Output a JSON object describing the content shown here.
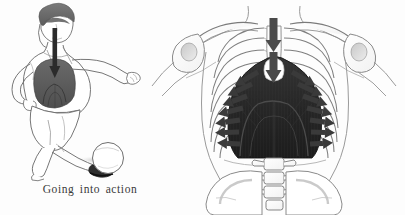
{
  "figure": {
    "caption": "Going into action",
    "panels": [
      {
        "id": "athlete",
        "name": "athlete-panel",
        "label": "Going into action",
        "description": "Line drawing of a female athlete kicking a football, shown in mid-action, with the hair and the diaphragm shaded dark and an arrow tracing the breath travelling down from the head through the throat into the diaphragm.",
        "elements": [
          {
            "name": "head-hair",
            "label": "Hair",
            "color": "#6b6b6b"
          },
          {
            "name": "breath-arrow",
            "label": "Breath arrow",
            "color": "#2b2b2b"
          },
          {
            "name": "diaphragm-shade",
            "label": "Diaphragm",
            "color": "#5e5e5e"
          },
          {
            "name": "football",
            "label": "Football",
            "color": "#ffffff"
          },
          {
            "name": "ground-shadow",
            "label": "Shadow",
            "color": "#9a9a9a"
          }
        ]
      },
      {
        "id": "anatomy",
        "name": "anatomy-panel",
        "label": "Thorax, ribcage and diaphragm",
        "description": "Anatomical front view of the upper torso showing clavicles, scapulae, humeral heads, the ribcage, sternum, the dome of the diaphragm shaded dark, lumbar vertebrae and the pelvis. Arrows indicate the direction of movement of air and the ribs during breathing.",
        "elements": [
          {
            "name": "clavicle",
            "label": "Clavicle"
          },
          {
            "name": "humerus-head",
            "label": "Head of humerus"
          },
          {
            "name": "ribcage",
            "label": "Ribcage"
          },
          {
            "name": "sternum",
            "label": "Sternum"
          },
          {
            "name": "diaphragm",
            "label": "Diaphragm",
            "color": "#2a2a2a"
          },
          {
            "name": "lumbar-spine",
            "label": "Lumbar vertebrae"
          },
          {
            "name": "pelvis",
            "label": "Pelvis"
          },
          {
            "name": "airflow-arrow",
            "label": "Airflow arrow",
            "color": "#4a4a4a"
          },
          {
            "name": "rib-expansion-arrow",
            "label": "Rib expansion arrow",
            "color": "#3a3a3a"
          }
        ]
      }
    ]
  },
  "colors": {
    "background": "#fdfdfd",
    "outline": "#6f6f6f",
    "outline_dark": "#4a4a4a",
    "diaphragm_dark": "#2a2a2a",
    "hair_gray": "#6b6b6b",
    "arrow_gray": "#4a4a4a",
    "caption_text": "#3a3a3a"
  }
}
